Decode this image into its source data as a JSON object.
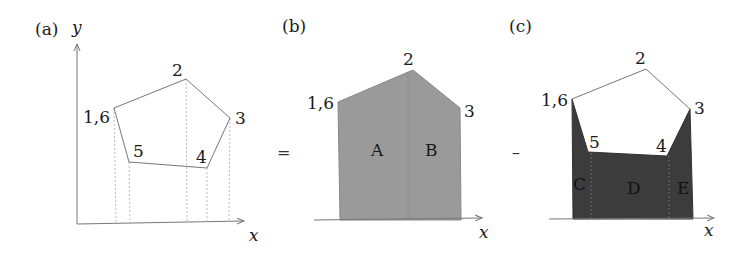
{
  "panels": {
    "a": {
      "label": "(a)",
      "y_axis": "y",
      "x_axis": "x",
      "vertices": {
        "v16": "1,6",
        "v2": "2",
        "v3": "3",
        "v4": "4",
        "v5": "5"
      }
    },
    "b": {
      "label": "(b)",
      "x_axis": "x",
      "vertices": {
        "v16": "1,6",
        "v2": "2",
        "v3": "3"
      },
      "regions": {
        "A": "A",
        "B": "B"
      },
      "fill": "#9a9a9a"
    },
    "c": {
      "label": "(c)",
      "x_axis": "x",
      "vertices": {
        "v16": "1,6",
        "v2": "2",
        "v3": "3",
        "v4": "4",
        "v5": "5"
      },
      "regions": {
        "C": "C",
        "D": "D",
        "E": "E"
      },
      "fill": "#3c3c3c"
    }
  },
  "operators": {
    "equals": "=",
    "minus": "–"
  }
}
